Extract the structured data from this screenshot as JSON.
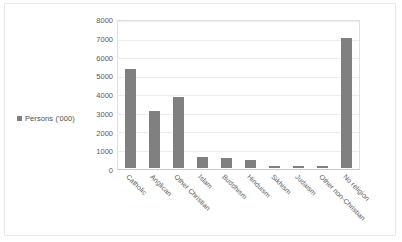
{
  "chart_data": {
    "type": "bar",
    "title": "",
    "xlabel": "",
    "ylabel": "",
    "ylim": [
      0,
      8000
    ],
    "yticks": [
      8000,
      7000,
      6000,
      5000,
      4000,
      3000,
      2000,
      1000,
      0
    ],
    "grid": true,
    "legend_position": "left",
    "series_name": "Persons ('000)",
    "bar_color": "#808080",
    "categories": [
      "Catholic",
      "Anglican",
      "Other Christian",
      "Islam",
      "Buddhism",
      "Hinduism",
      "Sikhism",
      "Judaism",
      "Other non-Christian",
      "No religion"
    ],
    "values": [
      5330,
      3100,
      3830,
      600,
      550,
      450,
      125,
      100,
      110,
      7050
    ]
  },
  "legend": {
    "label": "Persons ('000)",
    "marker": "legend-swatch"
  }
}
